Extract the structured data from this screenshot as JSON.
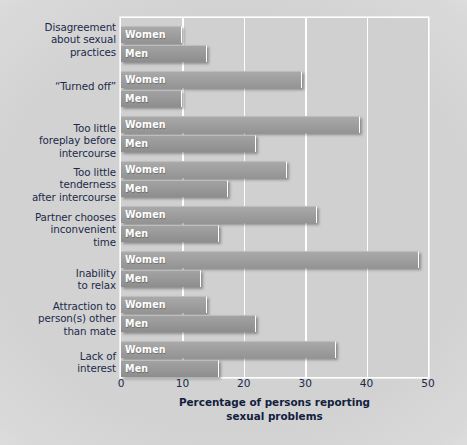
{
  "chart_data": {
    "type": "bar",
    "orientation": "horizontal",
    "title": "",
    "xlabel": "Percentage of persons reporting sexual problems",
    "ylabel": "",
    "xlim": [
      0,
      50
    ],
    "xticks": [
      0,
      10,
      20,
      30,
      40,
      50
    ],
    "grid": true,
    "legend": "inline-bar-labels",
    "series_names": [
      "Women",
      "Men"
    ],
    "categories": [
      "Disagreement\nabout sexual\npractices",
      "“Turned off”",
      "Too little\nforeplay before\nintercourse",
      "Too little\ntenderness\nafter intercourse",
      "Partner chooses\ninconvenient\ntime",
      "Inability\nto relax",
      "Attraction to\nperson(s) other\nthan mate",
      "Lack of\ninterest"
    ],
    "series": [
      {
        "name": "Women",
        "values": [
          10,
          29.5,
          39,
          27,
          32,
          48.5,
          14,
          35
        ]
      },
      {
        "name": "Men",
        "values": [
          14,
          10,
          22,
          17.5,
          16,
          13,
          22,
          16
        ]
      }
    ],
    "colors": {
      "women_bar": "#9d9d9d",
      "men_bar": "#979797",
      "plot_background": "#d0d0d0",
      "gridline": "#ffffff",
      "label_text": "#1b2a4a",
      "bar_label_text": "#ffffff"
    }
  },
  "axis": {
    "tick_labels": [
      "0",
      "10",
      "20",
      "30",
      "40",
      "50"
    ],
    "title_line1": "Percentage of persons reporting",
    "title_line2": "sexual problems"
  },
  "bar_labels": {
    "women": "Women",
    "men": "Men"
  }
}
